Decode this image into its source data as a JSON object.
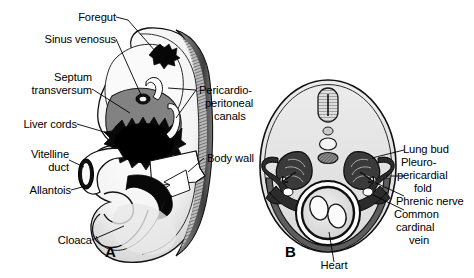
{
  "figure": {
    "background": "#ffffff",
    "ink": "#000000",
    "palette": {
      "white": "#ffffff",
      "pale_gray": "#e8e8e8",
      "light_gray": "#d2d2d2",
      "mid_gray": "#9a9a9a",
      "dark_gray": "#6b6b6b",
      "black": "#000000"
    }
  },
  "panels": [
    {
      "id": "A",
      "label": "A",
      "caption": "Sagittal view of embryo"
    },
    {
      "id": "B",
      "label": "B",
      "caption": "Transverse section of embryo"
    }
  ],
  "panel_a": {
    "label": "A",
    "labels": [
      {
        "text": "Foregut",
        "align": "right"
      },
      {
        "text": "Sinus venosus",
        "align": "right"
      },
      {
        "text": "Septum\ntransversum",
        "align": "right"
      },
      {
        "text": "Liver cords",
        "align": "right"
      },
      {
        "text": "Vitelline\nduct",
        "align": "right"
      },
      {
        "text": "Allantois",
        "align": "right"
      },
      {
        "text": "Cloaca",
        "align": "right"
      },
      {
        "text": "Pericardio-\nperitoneal\ncanals",
        "align": "left"
      },
      {
        "text": "Body wall",
        "align": "left"
      }
    ],
    "label_text": {
      "foregut": "Foregut",
      "sinus_venosus": "Sinus venosus",
      "septum_transversum_1": "Septum",
      "septum_transversum_2": "transversum",
      "liver_cords": "Liver cords",
      "vitelline_1": "Vitelline",
      "vitelline_2": "duct",
      "allantois": "Allantois",
      "cloaca": "Cloaca",
      "pericardio_1": "Pericardio-",
      "pericardio_2": "peritoneal",
      "pericardio_3": "canals",
      "body_wall": "Body wall"
    }
  },
  "panel_b": {
    "label": "B",
    "labels": [
      {
        "text": "Lung bud",
        "align": "left"
      },
      {
        "text": "Pleuro-\npericardial\nfold",
        "align": "left"
      },
      {
        "text": "Phrenic nerve",
        "align": "left"
      },
      {
        "text": "Common\ncardinal\nvein",
        "align": "left"
      },
      {
        "text": "Heart",
        "align": "center"
      }
    ],
    "label_text": {
      "lung_bud": "Lung bud",
      "pleuro_1": "Pleuro-",
      "pleuro_2": "pericardial",
      "pleuro_3": "fold",
      "phrenic_nerve": "Phrenic nerve",
      "common_1": "Common",
      "common_2": "cardinal",
      "common_3": "vein",
      "heart": "Heart"
    }
  }
}
